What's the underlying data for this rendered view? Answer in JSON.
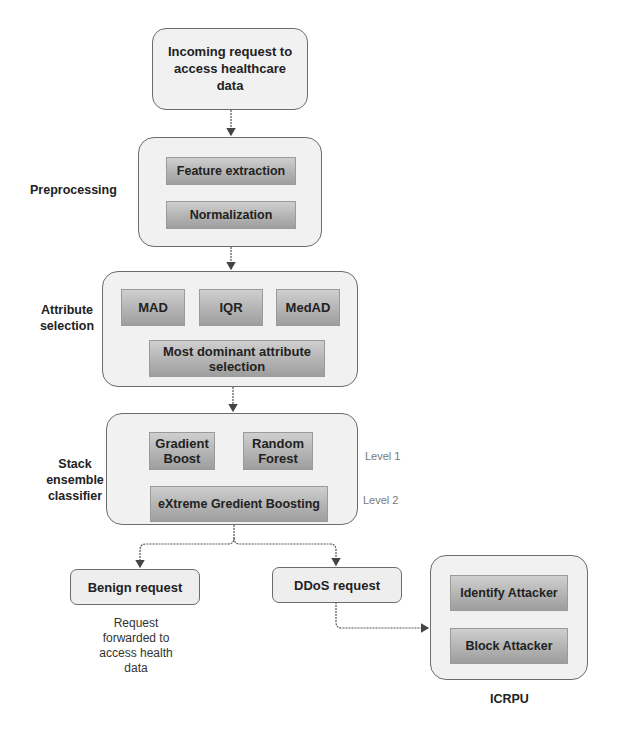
{
  "diagram": {
    "start": {
      "label": "Incoming request to access healthcare data"
    },
    "preprocessing": {
      "side_label": "Preprocessing",
      "steps": [
        "Feature extraction",
        "Normalization"
      ]
    },
    "attribute_selection": {
      "side_label": "Attribute selection",
      "methods": [
        "MAD",
        "IQR",
        "MedAD"
      ],
      "result": "Most dominant attribute selection"
    },
    "stack_ensemble": {
      "side_label": "Stack ensemble classifier",
      "level1_models": [
        "Gradient Boost",
        "Random Forest"
      ],
      "level2_model": "eXtreme Gredient Boosting",
      "level_labels": [
        "Level 1",
        "Level 2"
      ]
    },
    "outcomes": {
      "benign": {
        "label": "Benign request",
        "note": "Request forwarded to access health data"
      },
      "ddos": {
        "label": "DDoS request"
      }
    },
    "icrpu": {
      "title": "ICRPU",
      "actions": [
        "Identify Attacker",
        "Block Attacker"
      ]
    }
  },
  "colors": {
    "outer_fill": "#f1f1f1",
    "outer_border": "#6c6c6c",
    "inner_fill": "#b3b3b3",
    "arrow": "#555555"
  }
}
